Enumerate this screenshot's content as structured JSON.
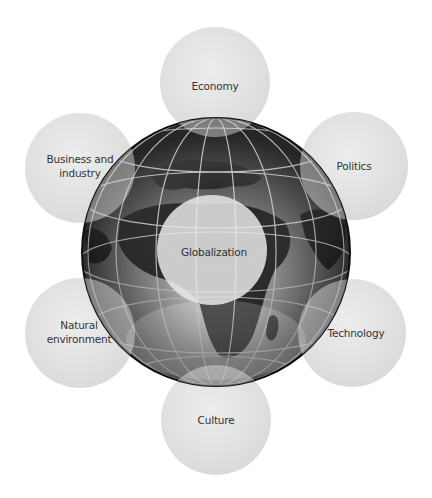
{
  "diagram": {
    "type": "hub-and-spoke",
    "center": {
      "label": "Globalization",
      "x": 212,
      "y": 250,
      "r": 55
    },
    "globe": {
      "cx": 216,
      "cy": 252,
      "r": 134
    },
    "nodes": [
      {
        "id": "economy",
        "label": "Economy",
        "x": 215,
        "y": 82,
        "r": 55
      },
      {
        "id": "politics",
        "label": "Politics",
        "x": 354,
        "y": 166,
        "r": 54
      },
      {
        "id": "technology",
        "label": "Technology",
        "x": 352,
        "y": 333,
        "r": 54
      },
      {
        "id": "culture",
        "label": "Culture",
        "x": 216,
        "y": 420,
        "r": 55
      },
      {
        "id": "natural",
        "label": "Natural\nenvironment",
        "x": 80,
        "y": 333,
        "r": 55
      },
      {
        "id": "business",
        "label": "Business and\nindustry",
        "x": 80,
        "y": 168,
        "r": 55
      }
    ],
    "colors": {
      "background": "#ffffff",
      "bubble": "#e4e4e4",
      "text": "#333333",
      "globe_dark": "#1a1a1a",
      "globe_mid": "#6e6e6e",
      "grid": "#d8d8d8"
    }
  }
}
